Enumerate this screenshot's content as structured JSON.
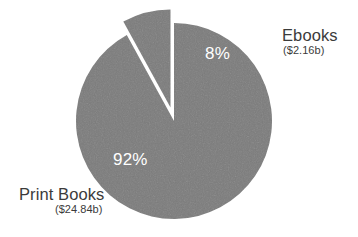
{
  "chart_data": {
    "type": "pie",
    "title": "",
    "subtitle": "",
    "xlabel": "",
    "ylabel": "",
    "legend_position": "none",
    "grid": false,
    "units": "billions of USD",
    "total_value": 27.0,
    "categories": [
      "Print Books",
      "Ebooks"
    ],
    "values": [
      24.84,
      2.16
    ],
    "percentages": [
      92,
      8
    ],
    "slices": [
      {
        "label": "Print Books",
        "percent_label": "92%",
        "percent": 92,
        "value": 24.84,
        "value_label": "($24.84b)",
        "color": "#7b7b7b",
        "exploded": false,
        "start_angle_deg": 28.8,
        "end_angle_deg": 360
      },
      {
        "label": "Ebooks",
        "percent_label": "8%",
        "percent": 8,
        "value": 2.16,
        "value_label": "($2.16b)",
        "color": "#7b7b7b",
        "exploded": true,
        "start_angle_deg": 0,
        "end_angle_deg": 28.8
      }
    ]
  },
  "figure": {
    "background_color": "#ffffff",
    "slice_color": "#7b7b7b",
    "label_color": "#3b3b3b",
    "percent_label_color": "#ffffff",
    "center_x": 174,
    "center_y": 121,
    "radius": 98,
    "explode_offset": 14
  },
  "labels": {
    "ebooks": {
      "name": "Ebooks",
      "value": "($2.16b)"
    },
    "print_books": {
      "name": "Print Books",
      "value": "($24.84b)"
    }
  },
  "percent_labels": {
    "ebooks": "8%",
    "print_books": "92%"
  }
}
